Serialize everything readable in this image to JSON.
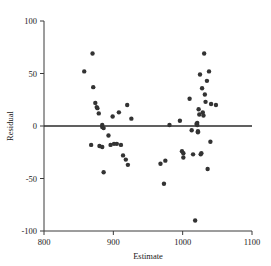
{
  "chart_data": {
    "type": "scatter",
    "title": "",
    "xlabel": "Estimate",
    "ylabel": "Residual",
    "xlim": [
      800,
      1100
    ],
    "ylim": [
      -100,
      100
    ],
    "xticks": [
      800,
      900,
      1000,
      1100
    ],
    "yticks": [
      -100,
      -50,
      0,
      50,
      100
    ],
    "xtick_labels": [
      "800",
      "900",
      "1000",
      "1100"
    ],
    "ytick_labels": [
      "-100",
      "-50",
      "0",
      "50",
      "100"
    ],
    "grid": false,
    "legend": null,
    "reference_line": {
      "orientation": "horizontal",
      "y": 0,
      "color": "#2b2b2b"
    },
    "marker": {
      "shape": "circle",
      "color": "#333333",
      "size": 2.2
    },
    "points": [
      {
        "x": 858,
        "y": 52
      },
      {
        "x": 870,
        "y": 69
      },
      {
        "x": 871,
        "y": 37
      },
      {
        "x": 874,
        "y": 22
      },
      {
        "x": 876,
        "y": 18
      },
      {
        "x": 877,
        "y": 17
      },
      {
        "x": 879,
        "y": 12
      },
      {
        "x": 884,
        "y": 1
      },
      {
        "x": 884,
        "y": -1
      },
      {
        "x": 886,
        "y": -2
      },
      {
        "x": 868,
        "y": -18
      },
      {
        "x": 880,
        "y": -19
      },
      {
        "x": 884,
        "y": -20
      },
      {
        "x": 886,
        "y": -44
      },
      {
        "x": 893,
        "y": -9
      },
      {
        "x": 896,
        "y": -18
      },
      {
        "x": 899,
        "y": 9
      },
      {
        "x": 901,
        "y": -17
      },
      {
        "x": 905,
        "y": -17
      },
      {
        "x": 908,
        "y": 13
      },
      {
        "x": 911,
        "y": -18
      },
      {
        "x": 914,
        "y": -28
      },
      {
        "x": 918,
        "y": -32
      },
      {
        "x": 920,
        "y": 20
      },
      {
        "x": 921,
        "y": -37
      },
      {
        "x": 926,
        "y": 7
      },
      {
        "x": 968,
        "y": -36
      },
      {
        "x": 973,
        "y": -55
      },
      {
        "x": 975,
        "y": -33
      },
      {
        "x": 981,
        "y": 1
      },
      {
        "x": 996,
        "y": 5
      },
      {
        "x": 999,
        "y": -24
      },
      {
        "x": 1001,
        "y": -26
      },
      {
        "x": 1001,
        "y": -30
      },
      {
        "x": 1010,
        "y": 26
      },
      {
        "x": 1013,
        "y": -4
      },
      {
        "x": 1015,
        "y": -27
      },
      {
        "x": 1018,
        "y": -90
      },
      {
        "x": 1020,
        "y": 2
      },
      {
        "x": 1021,
        "y": 1
      },
      {
        "x": 1021,
        "y": 3
      },
      {
        "x": 1022,
        "y": -5
      },
      {
        "x": 1022,
        "y": -6
      },
      {
        "x": 1023,
        "y": 16
      },
      {
        "x": 1024,
        "y": 11
      },
      {
        "x": 1025,
        "y": 49
      },
      {
        "x": 1026,
        "y": -27
      },
      {
        "x": 1027,
        "y": -26
      },
      {
        "x": 1028,
        "y": 36
      },
      {
        "x": 1029,
        "y": 13
      },
      {
        "x": 1030,
        "y": 10
      },
      {
        "x": 1031,
        "y": 69
      },
      {
        "x": 1032,
        "y": 30
      },
      {
        "x": 1033,
        "y": 23
      },
      {
        "x": 1035,
        "y": 43
      },
      {
        "x": 1036,
        "y": -41
      },
      {
        "x": 1038,
        "y": 52
      },
      {
        "x": 1040,
        "y": -15
      },
      {
        "x": 1041,
        "y": 21
      },
      {
        "x": 1048,
        "y": 20
      }
    ]
  }
}
